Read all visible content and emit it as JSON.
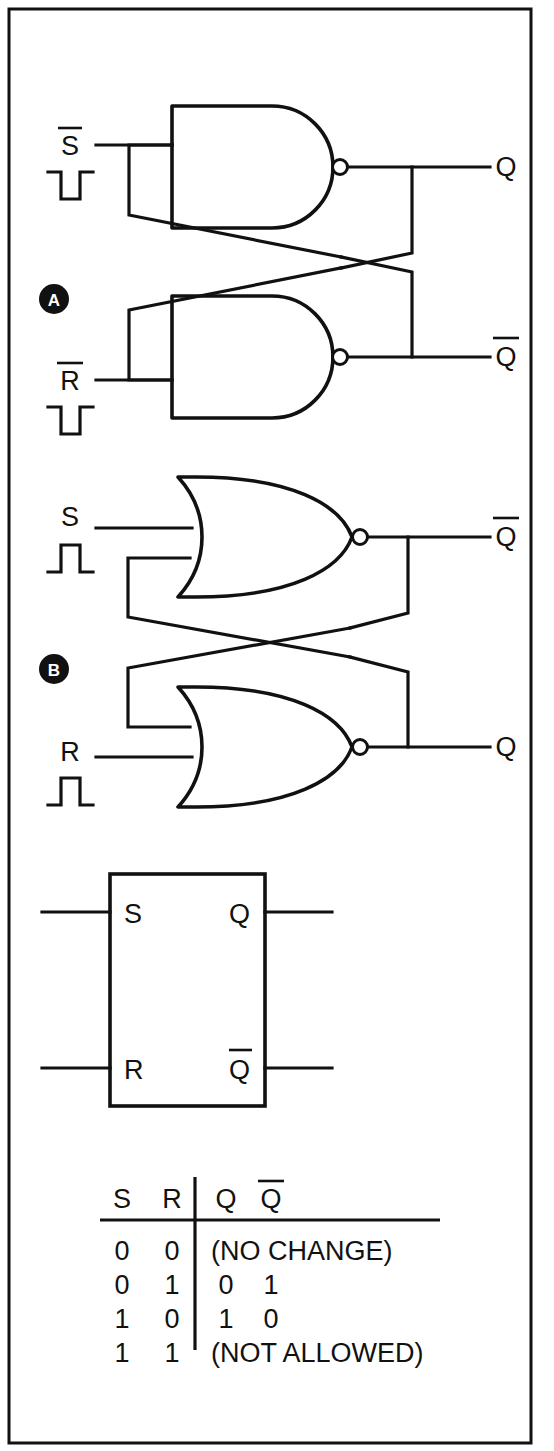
{
  "figure": {
    "border_color": "#111111",
    "ink_color": "#111111",
    "background": "#ffffff"
  },
  "sections": [
    {
      "badge": "A",
      "gate_type": "NAND",
      "pulse": "negative-going-pulse",
      "inputs": [
        {
          "label": "S",
          "overbar": true
        },
        {
          "label": "R",
          "overbar": true
        }
      ],
      "outputs": [
        {
          "label": "Q",
          "overbar": false
        },
        {
          "label": "Q",
          "overbar": true
        }
      ]
    },
    {
      "badge": "B",
      "gate_type": "NOR",
      "pulse": "positive-going-pulse",
      "inputs": [
        {
          "label": "S",
          "overbar": false
        },
        {
          "label": "R",
          "overbar": false
        }
      ],
      "outputs": [
        {
          "label": "Q",
          "overbar": true
        },
        {
          "label": "Q",
          "overbar": false
        }
      ]
    }
  ],
  "block_symbol": {
    "inputs": [
      {
        "label": "S",
        "overbar": false
      },
      {
        "label": "R",
        "overbar": false
      }
    ],
    "outputs": [
      {
        "label": "Q",
        "overbar": false
      },
      {
        "label": "Q",
        "overbar": true
      }
    ]
  },
  "truth_table": {
    "headers": [
      {
        "label": "S",
        "overbar": false
      },
      {
        "label": "R",
        "overbar": false
      },
      {
        "label": "Q",
        "overbar": false
      },
      {
        "label": "Q",
        "overbar": true
      }
    ],
    "rows": [
      {
        "s": "0",
        "r": "0",
        "span": true,
        "note": "(NO CHANGE)",
        "q": "",
        "qbar": ""
      },
      {
        "s": "0",
        "r": "1",
        "span": false,
        "note": "",
        "q": "0",
        "qbar": "1"
      },
      {
        "s": "1",
        "r": "0",
        "span": false,
        "note": "",
        "q": "1",
        "qbar": "0"
      },
      {
        "s": "1",
        "r": "1",
        "span": true,
        "note": "(NOT ALLOWED)",
        "q": "",
        "qbar": ""
      }
    ]
  }
}
